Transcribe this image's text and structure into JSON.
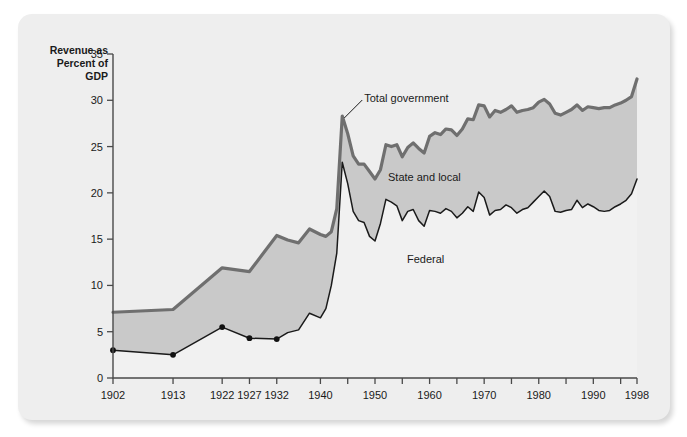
{
  "figure": {
    "axis_title": "Revenue as\nPercent of\nGDP",
    "frame_color": "#eeeeee",
    "background": "#ffffff"
  },
  "annotations": {
    "total": "Total government",
    "state_local": "State and local",
    "federal": "Federal"
  },
  "colors": {
    "state_local_fill": "#c9c9c9",
    "federal_fill": "#f1f1f1",
    "total_line": "#6f6f6f",
    "federal_line": "#1a1a1a",
    "axis": "#4a4a4a",
    "marker": "#111111"
  },
  "chart_data": {
    "type": "area",
    "title": "",
    "subtitle": "",
    "xlabel": "",
    "ylabel": "Revenue as Percent of GDP",
    "ylim": [
      0,
      35
    ],
    "xlim": [
      1902,
      1998
    ],
    "grid": false,
    "legend": "inline-annotations",
    "ytick_labels": [
      "0",
      "5",
      "10",
      "15",
      "20",
      "25",
      "30",
      "35"
    ],
    "yticks": [
      0,
      5,
      10,
      15,
      20,
      25,
      30,
      35
    ],
    "xtick_labels": [
      "1902",
      "1913",
      "1922",
      "1927",
      "1932",
      "1940",
      "1950",
      "1960",
      "1970",
      "1980",
      "1990",
      "1998"
    ],
    "xticks": [
      1902,
      1913,
      1922,
      1927,
      1932,
      1940,
      1950,
      1960,
      1970,
      1980,
      1990,
      1998
    ],
    "marker_years": [
      1902,
      1913,
      1922,
      1927,
      1932
    ],
    "x": [
      1902,
      1913,
      1922,
      1927,
      1932,
      1934,
      1936,
      1938,
      1940,
      1941,
      1942,
      1943,
      1944,
      1945,
      1946,
      1947,
      1948,
      1949,
      1950,
      1951,
      1952,
      1953,
      1954,
      1955,
      1956,
      1957,
      1958,
      1959,
      1960,
      1961,
      1962,
      1963,
      1964,
      1965,
      1966,
      1967,
      1968,
      1969,
      1970,
      1971,
      1972,
      1973,
      1974,
      1975,
      1976,
      1977,
      1978,
      1979,
      1980,
      1981,
      1982,
      1983,
      1984,
      1985,
      1986,
      1987,
      1988,
      1989,
      1990,
      1991,
      1992,
      1993,
      1994,
      1995,
      1996,
      1997,
      1998
    ],
    "series": [
      {
        "name": "Federal",
        "values": [
          3.0,
          2.5,
          5.5,
          4.3,
          4.2,
          4.9,
          5.2,
          7.0,
          6.5,
          7.5,
          10.0,
          13.5,
          23.3,
          21.0,
          18.0,
          17.0,
          16.8,
          15.3,
          14.8,
          16.7,
          19.3,
          19.0,
          18.6,
          17.0,
          18.0,
          18.2,
          17.0,
          16.4,
          18.1,
          18.0,
          17.8,
          18.3,
          18.0,
          17.3,
          17.8,
          18.5,
          18.0,
          20.1,
          19.5,
          17.6,
          18.1,
          18.2,
          18.7,
          18.4,
          17.8,
          18.2,
          18.4,
          19.0,
          19.6,
          20.2,
          19.6,
          18.0,
          17.9,
          18.1,
          18.2,
          19.2,
          18.4,
          18.8,
          18.5,
          18.1,
          18.0,
          18.1,
          18.5,
          18.8,
          19.2,
          19.9,
          21.5
        ]
      },
      {
        "name": "State and local",
        "values": [
          4.1,
          4.9,
          6.4,
          7.2,
          11.2,
          10.0,
          9.4,
          9.1,
          9.0,
          7.8,
          5.8,
          4.8,
          5.0,
          5.4,
          6.0,
          6.1,
          6.3,
          7.0,
          6.7,
          5.8,
          5.9,
          6.0,
          6.6,
          6.9,
          6.9,
          7.2,
          7.8,
          7.9,
          8.0,
          8.5,
          8.5,
          8.6,
          8.8,
          8.9,
          9.1,
          9.5,
          9.9,
          9.4,
          9.9,
          10.6,
          10.8,
          10.5,
          10.3,
          11.0,
          10.9,
          10.7,
          10.6,
          10.2,
          10.2,
          9.9,
          10.0,
          10.6,
          10.5,
          10.6,
          10.8,
          10.3,
          10.5,
          10.5,
          10.7,
          11.0,
          11.2,
          11.1,
          11.0,
          10.9,
          10.8,
          10.5,
          10.8
        ]
      }
    ],
    "total": {
      "name": "Total government",
      "values": [
        7.1,
        7.4,
        11.9,
        11.5,
        15.4,
        14.9,
        14.6,
        16.1,
        15.5,
        15.3,
        15.8,
        18.3,
        28.3,
        26.4,
        24.0,
        23.1,
        23.1,
        22.3,
        21.5,
        22.5,
        25.2,
        25.0,
        25.2,
        23.9,
        24.9,
        25.4,
        24.8,
        24.3,
        26.1,
        26.5,
        26.3,
        26.9,
        26.8,
        26.2,
        26.9,
        28.0,
        27.9,
        29.5,
        29.4,
        28.2,
        28.9,
        28.7,
        29.0,
        29.4,
        28.7,
        28.9,
        29.0,
        29.2,
        29.8,
        30.1,
        29.6,
        28.6,
        28.4,
        28.7,
        29.0,
        29.5,
        28.9,
        29.3,
        29.2,
        29.1,
        29.2,
        29.2,
        29.5,
        29.7,
        30.0,
        30.4,
        32.3
      ]
    }
  }
}
